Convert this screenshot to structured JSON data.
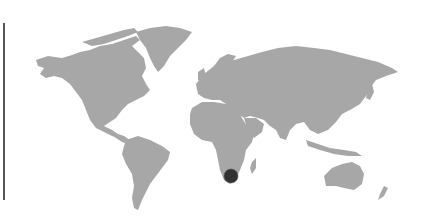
{
  "map": {
    "type": "world-map",
    "land_color": "#a7a7a7",
    "background_color": "#ffffff",
    "markers": [
      {
        "region": "South Africa",
        "x": 231,
        "y": 176,
        "radius": 7,
        "color": "#333333"
      }
    ]
  },
  "divider": {
    "color": "#555555"
  }
}
